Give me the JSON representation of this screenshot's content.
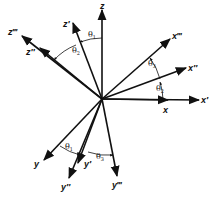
{
  "origin": {
    "x": 102,
    "y": 99
  },
  "axes": [
    {
      "id": "z",
      "label": "z",
      "tip": [
        102,
        10
      ],
      "label_pos": [
        100,
        9
      ]
    },
    {
      "id": "z1",
      "label": "z′",
      "tip": [
        73,
        23
      ],
      "label_pos": [
        63,
        27
      ]
    },
    {
      "id": "z2",
      "label": "z″",
      "tip": [
        40,
        48
      ],
      "label_pos": [
        26,
        55
      ]
    },
    {
      "id": "z3",
      "label": "z‴",
      "tip": [
        22,
        36
      ],
      "label_pos": [
        8,
        35
      ]
    },
    {
      "id": "x3",
      "label": "x‴",
      "tip": [
        170,
        39
      ],
      "label_pos": [
        172,
        39
      ]
    },
    {
      "id": "x2",
      "label": "x″",
      "tip": [
        186,
        68
      ],
      "label_pos": [
        188,
        71
      ]
    },
    {
      "id": "x",
      "label": "x",
      "tip": [
        168,
        100
      ],
      "label_pos": [
        163,
        113
      ]
    },
    {
      "id": "x1",
      "label": "x′",
      "tip": [
        199,
        100
      ],
      "label_pos": [
        201,
        103
      ]
    },
    {
      "id": "y",
      "label": "y",
      "tip": [
        44,
        160
      ],
      "label_pos": [
        34,
        167
      ]
    },
    {
      "id": "y1",
      "label": "y′",
      "tip": [
        78,
        163
      ],
      "label_pos": [
        84,
        167
      ]
    },
    {
      "id": "y2",
      "label": "y″",
      "tip": [
        69,
        178
      ],
      "label_pos": [
        61,
        190
      ]
    },
    {
      "id": "y3",
      "label": "y‴",
      "tip": [
        117,
        176
      ],
      "label_pos": [
        112,
        188
      ]
    }
  ],
  "angles": [
    {
      "label": "θ",
      "sub": "1",
      "pos": [
        88,
        37
      ]
    },
    {
      "label": "θ",
      "sub": "2",
      "pos": [
        72,
        53
      ]
    },
    {
      "label": "θ",
      "sub": "3",
      "pos": [
        148,
        66
      ]
    },
    {
      "label": "θ",
      "sub": "2",
      "pos": [
        156,
        91
      ]
    },
    {
      "label": "θ",
      "sub": "1",
      "pos": [
        65,
        149
      ]
    },
    {
      "label": "θ",
      "sub": "3",
      "pos": [
        96,
        159
      ]
    }
  ]
}
